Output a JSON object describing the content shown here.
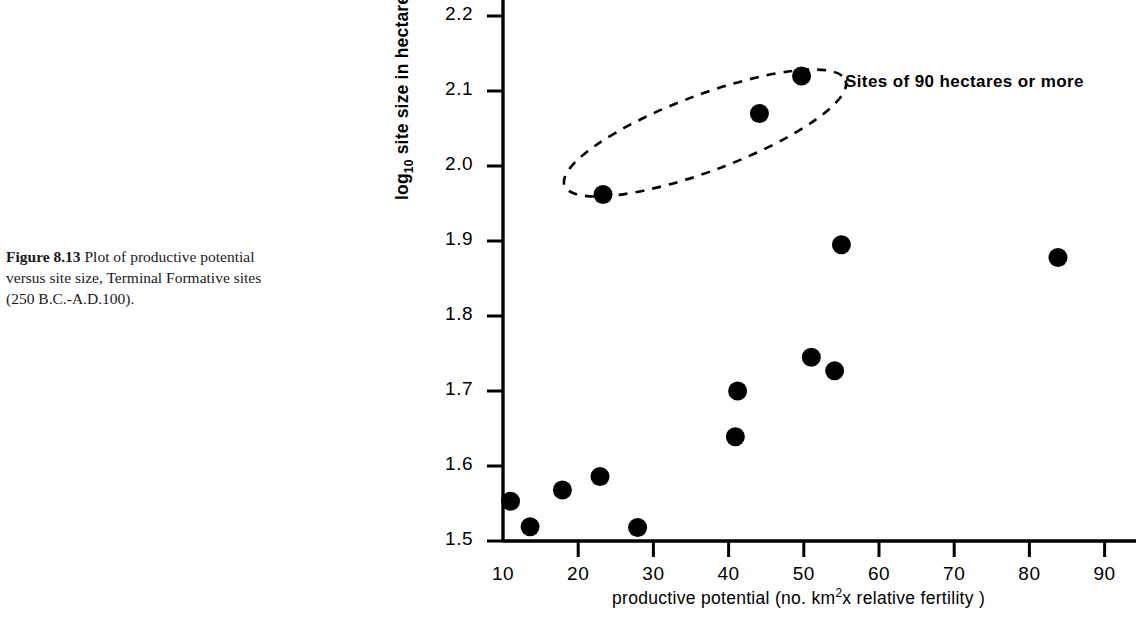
{
  "caption": {
    "figure_number": "Figure 8.13",
    "lines": [
      "Plot of productive potential",
      "versus site size,  Terminal Formative sites",
      "(250 B.C.-A.D.100)."
    ],
    "line1_rest": "  Plot of productive potential",
    "line2": "versus site size,  Terminal Formative sites",
    "line3": "(250 B.C.-A.D.100)."
  },
  "annotation": {
    "group_label": "Sites of 90 hectares or more"
  },
  "chart_data": {
    "type": "scatter",
    "title": "",
    "xlabel": "productive potential (no. km2x relative fertility)",
    "xlabel_parts": {
      "before": "productive  potential (no. km",
      "superscript": "2",
      "after": "x relative fertility )"
    },
    "ylabel": "log10 site size in hectares",
    "ylabel_parts": {
      "before": "log",
      "subscript": "10",
      "after": " site size in hectares"
    },
    "xlim": [
      10,
      92
    ],
    "ylim": [
      1.5,
      2.23
    ],
    "xticks": [
      10,
      20,
      30,
      40,
      50,
      60,
      70,
      80,
      90
    ],
    "xtick_labels": [
      "10",
      "20",
      "30",
      "40",
      "50",
      "60",
      "70",
      "80",
      "90"
    ],
    "yticks": [
      1.5,
      1.6,
      1.7,
      1.8,
      1.9,
      2.0,
      2.1,
      2.2
    ],
    "ytick_labels": [
      "1.5",
      "1.6",
      "1.7",
      "1.8",
      "1.9",
      "2.0",
      "2.1",
      "2.2"
    ],
    "grid": false,
    "legend": false,
    "marker": "filled-circle",
    "marker_color": "#000000",
    "points": [
      {
        "x": 11.0,
        "y": 1.553
      },
      {
        "x": 13.6,
        "y": 1.519
      },
      {
        "x": 17.9,
        "y": 1.568
      },
      {
        "x": 22.9,
        "y": 1.586
      },
      {
        "x": 23.3,
        "y": 1.962
      },
      {
        "x": 27.9,
        "y": 1.518
      },
      {
        "x": 40.9,
        "y": 1.639
      },
      {
        "x": 41.2,
        "y": 1.7
      },
      {
        "x": 44.1,
        "y": 2.07
      },
      {
        "x": 49.7,
        "y": 2.12
      },
      {
        "x": 51.0,
        "y": 1.745
      },
      {
        "x": 54.1,
        "y": 1.727
      },
      {
        "x": 55.0,
        "y": 1.895
      },
      {
        "x": 83.8,
        "y": 1.878
      }
    ],
    "enclosed_group": {
      "label": "Sites of 90 hectares or more",
      "style": "dashed-ellipse",
      "member_points": [
        {
          "x": 23.3,
          "y": 1.962
        },
        {
          "x": 44.1,
          "y": 2.07
        },
        {
          "x": 49.7,
          "y": 2.12
        }
      ]
    }
  }
}
